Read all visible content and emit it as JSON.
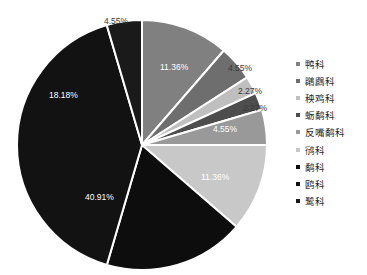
{
  "chart_data": {
    "type": "pie",
    "title": "",
    "categories": [
      "鸭科",
      "鸊鷉科",
      "秧鸡科",
      "蛎鹬科",
      "反嘴鹬科",
      "鸻科",
      "鹬科",
      "鸥科",
      "鹭科"
    ],
    "values": [
      11.36,
      4.55,
      2.27,
      2.27,
      4.55,
      11.36,
      18.18,
      40.91,
      4.55
    ],
    "value_labels": [
      "11.36%",
      "4.55%",
      "2.27%",
      "2.27%",
      "4.55%",
      "11.36%",
      "18.18%",
      "40.91%",
      "4.55%"
    ],
    "colors": [
      "#808080",
      "#6e6e6e",
      "#bfbfbf",
      "#4d4d4d",
      "#999999",
      "#c8c8c8",
      "#0d0d0d",
      "#121212",
      "#1a1a1a"
    ],
    "label_colors": [
      "#ffffff",
      "#3a3a3a",
      "#3a3a3a",
      "#3a3a3a",
      "#ffffff",
      "#ffffff",
      "#ffffff",
      "#ffffff",
      "#3a3a3a"
    ],
    "start_angle": 0,
    "direction": "clockwise",
    "legend_position": "right",
    "grid": false,
    "xlabel": "",
    "ylabel": ""
  },
  "legend": {
    "items": [
      {
        "label": "鸭科",
        "color": "#808080"
      },
      {
        "label": "鸊鷉科",
        "color": "#6e6e6e"
      },
      {
        "label": "秧鸡科",
        "color": "#bfbfbf"
      },
      {
        "label": "蛎鹬科",
        "color": "#4d4d4d"
      },
      {
        "label": "反嘴鹬科",
        "color": "#999999"
      },
      {
        "label": "鸻科",
        "color": "#c8c8c8"
      },
      {
        "label": "鹬科",
        "color": "#0d0d0d"
      },
      {
        "label": "鸥科",
        "color": "#121212"
      },
      {
        "label": "鹭科",
        "color": "#1a1a1a"
      }
    ]
  },
  "labels": {
    "top_outside": "4.55%",
    "right_1": "4.55%",
    "right_2": "2.27%",
    "right_3": "2.27%"
  }
}
